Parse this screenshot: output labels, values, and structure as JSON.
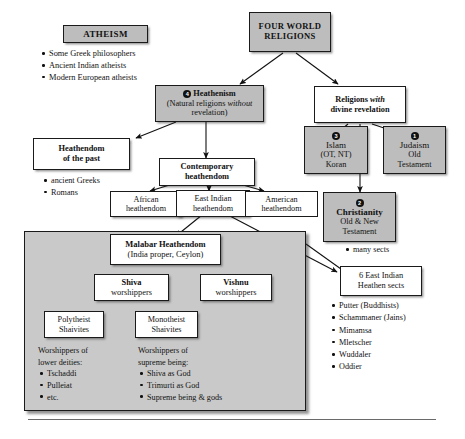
{
  "diagram": {
    "colors": {
      "shade": "#bdbdbd",
      "panel": "#c9c9c9",
      "ink": "#111111",
      "paper": "#ffffff"
    }
  },
  "nodes": {
    "atheism": {
      "label": "ATHEISM"
    },
    "four_world_religions": {
      "line1": "FOUR WORLD",
      "line2": "RELIGIONS"
    },
    "heathenism": {
      "badge": "4",
      "line1": "Heathenism",
      "line2a": "(Natural religions ",
      "line2b": "without",
      "line3": "revelation)"
    },
    "revelation": {
      "line1a": "Religions ",
      "line1b": "with",
      "line2": "divine revelation"
    },
    "heathendom_past": {
      "line1": "Heathendom",
      "line2": "of the past"
    },
    "contemporary": {
      "line1": "Contemporary",
      "line2": "heathendom"
    },
    "african": {
      "line1": "African",
      "line2": "heathendom"
    },
    "east_indian": {
      "line1": "East Indian",
      "line2": "heathendom"
    },
    "american": {
      "line1": "American",
      "line2": "heathendom"
    },
    "islam": {
      "badge": "3",
      "line1": "Islam",
      "line2": "(OT, NT)",
      "line3": "Koran"
    },
    "judaism": {
      "badge": "1",
      "line1": "Judaism",
      "line2": "Old",
      "line3": "Testament"
    },
    "christianity": {
      "badge": "2",
      "line1": "Christianity",
      "line2": "Old & New",
      "line3": "Testament"
    },
    "east_indian_sects": {
      "line1": "6 East Indian",
      "line2": "Heathen sects"
    },
    "malabar": {
      "line1": "Malabar Heathendom",
      "line2": "(India proper, Ceylon)"
    },
    "shiva": {
      "line1": "Shiva",
      "line2": "worshippers"
    },
    "vishnu": {
      "line1": "Vishnu",
      "line2": "worshippers"
    },
    "polytheist": {
      "line1": "Polytheist",
      "line2": "Shaivites"
    },
    "monotheist": {
      "line1": "Monotheist",
      "line2": "Shaivites"
    }
  },
  "lists": {
    "atheism_items": [
      "Some Greek philosophers",
      "Ancient Indian atheists",
      "Modern European atheists"
    ],
    "past_items": [
      "ancient Greeks",
      "Romans"
    ],
    "christianity_items": [
      "many sects"
    ],
    "east_indian_sect_items": [
      "Putter (Buddhists)",
      "Schammaner (Jains)",
      "Mimamsa",
      "Mletscher",
      "Wuddaler",
      "Oddier"
    ],
    "polytheist_heading1": "Worshippers of",
    "polytheist_heading2": "lower deities:",
    "polytheist_items": [
      "Tschaddi",
      "Pulleiat",
      "etc."
    ],
    "monotheist_heading1": "Worshippers of",
    "monotheist_heading2": "supreme being:",
    "monotheist_items": [
      "Shiva as God",
      "Trimurti as God",
      "Supreme being & gods"
    ]
  },
  "caption": {
    "text": ""
  }
}
